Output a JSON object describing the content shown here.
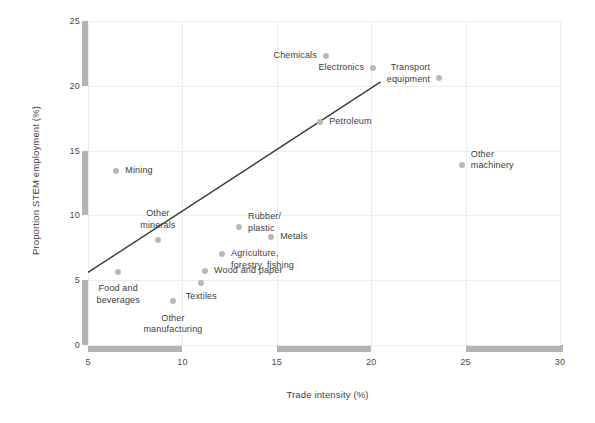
{
  "chart_data": {
    "type": "scatter",
    "title": "",
    "xlabel": "Trade intensity (%)",
    "ylabel": "Proportion STEM employment (%)",
    "xlim": [
      5,
      30
    ],
    "ylim": [
      0,
      25
    ],
    "xticks": [
      5,
      10,
      15,
      20,
      25,
      30
    ],
    "yticks": [
      0,
      5,
      10,
      15,
      20,
      25
    ],
    "grid": true,
    "legend": "none",
    "point_color": "#b9b9b9",
    "line_color": "#3a3a3a",
    "grid_color": "#ededed",
    "axis_band_color": "#b4b4b4",
    "points": [
      {
        "label": "Chemicals",
        "x": 17.6,
        "y": 22.3,
        "align": "r",
        "dx": -9,
        "dy": 0
      },
      {
        "label": "Electronics",
        "x": 20.1,
        "y": 21.4,
        "align": "r",
        "dx": -9,
        "dy": 0
      },
      {
        "label": "Transport\nequipment",
        "x": 23.6,
        "y": 20.6,
        "align": "r",
        "dx": -9,
        "dy": -5
      },
      {
        "label": "Petroleum",
        "x": 17.3,
        "y": 17.2,
        "align": "l",
        "dx": 9,
        "dy": 0
      },
      {
        "label": "Other\nmachinery",
        "x": 24.8,
        "y": 13.9,
        "align": "l",
        "dx": 9,
        "dy": -5
      },
      {
        "label": "Mining",
        "x": 6.5,
        "y": 13.4,
        "align": "l",
        "dx": 9,
        "dy": 0
      },
      {
        "label": "Other\nminerals",
        "x": 8.7,
        "y": 8.1,
        "align": "c",
        "dx": 0,
        "dy": -21
      },
      {
        "label": "Rubber/\nplastic",
        "x": 13.0,
        "y": 9.1,
        "align": "l",
        "dx": 9,
        "dy": -5
      },
      {
        "label": "Metals",
        "x": 14.7,
        "y": 8.3,
        "align": "l",
        "dx": 9,
        "dy": 0
      },
      {
        "label": "Agriculture,\nforestry, fishing",
        "x": 12.1,
        "y": 7.0,
        "align": "l",
        "dx": 9,
        "dy": 5
      },
      {
        "label": "Wood and paper",
        "x": 11.2,
        "y": 5.7,
        "align": "l",
        "dx": 9,
        "dy": 0
      },
      {
        "label": "Food and\nbeverages",
        "x": 6.6,
        "y": 5.6,
        "align": "c",
        "dx": 0,
        "dy": 22
      },
      {
        "label": "Textiles",
        "x": 11.0,
        "y": 4.8,
        "align": "c",
        "dx": 0,
        "dy": 14
      },
      {
        "label": "Other\nmanufacturing",
        "x": 9.5,
        "y": 3.4,
        "align": "c",
        "dx": 0,
        "dy": 23
      }
    ],
    "trend_line": {
      "x0": 5.0,
      "y0": 5.6,
      "x1": 20.5,
      "y1": 20.3
    }
  }
}
